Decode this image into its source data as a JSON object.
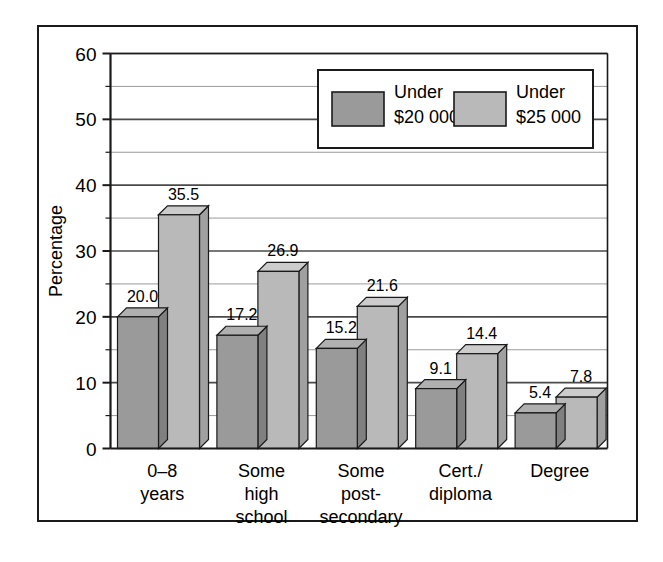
{
  "chart_data": {
    "type": "bar",
    "title": "",
    "xlabel": "",
    "ylabel": "Percentage",
    "ylim": [
      0,
      60
    ],
    "ytick_labels": [
      "0",
      "10",
      "20",
      "30",
      "40",
      "50",
      "60"
    ],
    "yticks": [
      0,
      10,
      20,
      30,
      40,
      50,
      60
    ],
    "minor_gridlines": [
      5,
      15,
      25,
      35,
      45,
      55
    ],
    "grid": true,
    "legend_position": "upper-center",
    "style": "3d-bar",
    "categories": [
      "0–8\nyears",
      "Some\nhigh\nschool",
      "Some\npost-\nsecondary",
      "Cert./\ndiploma",
      "Degree"
    ],
    "category_lines": [
      [
        "0–8",
        "years"
      ],
      [
        "Some",
        "high",
        "school"
      ],
      [
        "Some",
        "post-",
        "secondary"
      ],
      [
        "Cert./",
        "diploma"
      ],
      [
        "Degree"
      ]
    ],
    "series": [
      {
        "name": "Under $20 000",
        "legend_lines": [
          "Under",
          "$20 000"
        ],
        "color": "#9a9a9a",
        "values": [
          20.0,
          17.2,
          15.2,
          9.1,
          5.4
        ],
        "labels": [
          "20.0",
          "17.2",
          "15.2",
          "9.1",
          "5.4"
        ]
      },
      {
        "name": "Under $25 000",
        "legend_lines": [
          "Under",
          "$25 000"
        ],
        "color": "#b9b9b9",
        "values": [
          35.5,
          26.9,
          21.6,
          14.4,
          7.8
        ],
        "labels": [
          "35.5",
          "26.9",
          "21.6",
          "14.4",
          "7.8"
        ]
      }
    ]
  },
  "colors": {
    "series_1_front": "#9a9a9a",
    "series_1_top": "#b0b0b0",
    "series_1_side": "#808080",
    "series_2_front": "#b9b9b9",
    "series_2_top": "#cccccc",
    "series_2_side": "#a0a0a0",
    "frame": "#1a1a1a",
    "axis": "#1a1a1a",
    "major_grid": "#4a4a4a",
    "minor_grid": "#9a9a9a",
    "background": "#ffffff"
  },
  "legend": {
    "entries": [
      {
        "label_line_1": "Under",
        "label_line_2": "$20 000"
      },
      {
        "label_line_1": "Under",
        "label_line_2": "$25 000"
      }
    ]
  }
}
